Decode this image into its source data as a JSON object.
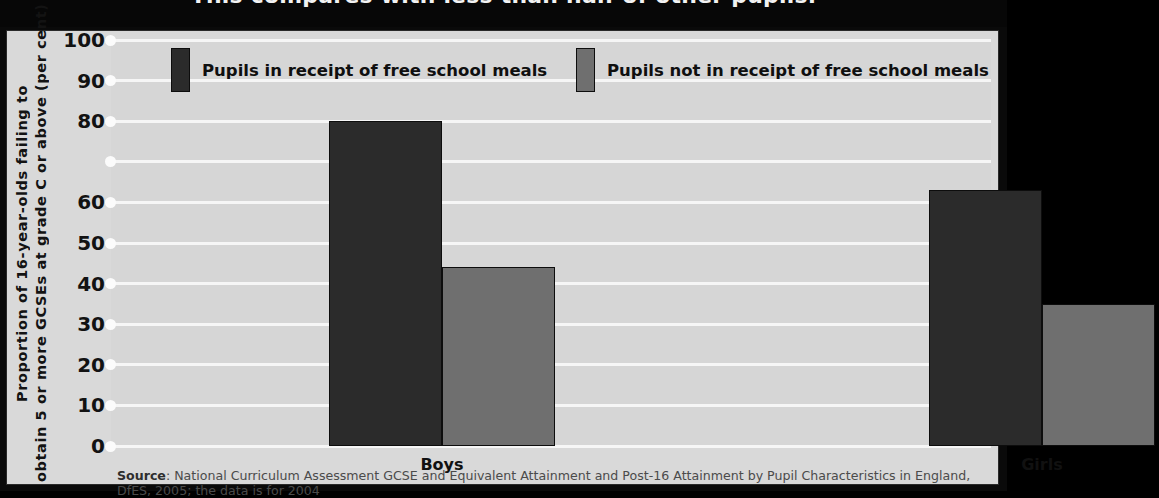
{
  "title": "This compares with less than half of other pupils.",
  "axis": {
    "y_title_line1": "Proportion of 16-year-olds failing to",
    "y_title_line2": "obtain 5 or more GCSEs at grade C or",
    "y_title_line3": "above (per cent)",
    "y_title_rendered_line1": "Proportion of 16-year-olds failing to",
    "y_title_rendered_line2": "obtain 5 or more GCSEs at grade C or above (per cent)"
  },
  "legend": [
    {
      "label": "Pupils in receipt of free school meals",
      "color": "#2b2b2b"
    },
    {
      "label": "Pupils not in receipt of free school meals",
      "color": "#6f6f6f"
    }
  ],
  "source": {
    "prefix": "Source",
    "text": ": National Curriculum Assessment GCSE and Equivalent Attainment and Post-16 Attainment by Pupil Characteristics in England, DfES, 2005; the data is for 2004"
  },
  "chart_data": {
    "type": "bar",
    "title": "This compares with less than half of other pupils.",
    "xlabel": "",
    "ylabel": "Proportion of 16-year-olds failing to obtain 5 or more GCSEs at grade C or above (per cent)",
    "ylim": [
      0,
      100
    ],
    "grid": true,
    "legend_position": "top",
    "categories": [
      "Boys",
      "Girls"
    ],
    "ytick_values": [
      100,
      90,
      80,
      70,
      60,
      50,
      40,
      30,
      20,
      10,
      0
    ],
    "ytick_labels": [
      "100",
      "90",
      "80",
      "",
      "60",
      "50",
      "40",
      "30",
      "20",
      "10",
      "0"
    ],
    "series": [
      {
        "name": "Pupils in receipt of free school meals",
        "color": "#2b2b2b",
        "values": [
          80,
          63
        ]
      },
      {
        "name": "Pupils not in receipt of free school meals",
        "color": "#6f6f6f",
        "values": [
          44,
          35
        ]
      }
    ]
  }
}
